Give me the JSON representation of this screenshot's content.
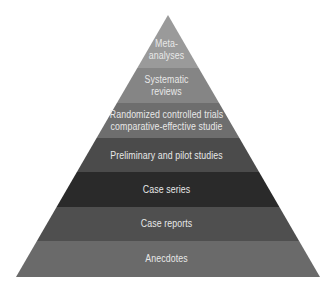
{
  "diagram": {
    "type": "pyramid",
    "apex": {
      "x": 168,
      "y": 15
    },
    "base_left_x": 16,
    "base_right_x": 320,
    "base_y": 277,
    "levels": [
      {
        "id": "meta",
        "line1": "Meta-",
        "line2": "analyses",
        "top": 15,
        "bottom": 68,
        "color": "#9a9a9a"
      },
      {
        "id": "systematic",
        "line1": "Systematic",
        "line2": "reviews",
        "top": 68,
        "bottom": 103,
        "color": "#858585"
      },
      {
        "id": "rct",
        "line1": "Randomized controlled trials",
        "line2": "comparative-effective studie",
        "top": 103,
        "bottom": 138,
        "color": "#6e6e6e"
      },
      {
        "id": "preliminary",
        "line1": "Preliminary and pilot studies",
        "line2": "",
        "top": 138,
        "bottom": 172,
        "color": "#4b4b4b"
      },
      {
        "id": "case-series",
        "line1": "Case series",
        "line2": "",
        "top": 172,
        "bottom": 207,
        "color": "#2a2a2a"
      },
      {
        "id": "case-reports",
        "line1": "Case reports",
        "line2": "",
        "top": 207,
        "bottom": 241,
        "color": "#4f4f4f"
      },
      {
        "id": "anecdotes",
        "line1": "Anecdotes",
        "line2": "",
        "top": 241,
        "bottom": 277,
        "color": "#6a6a6a"
      }
    ]
  }
}
